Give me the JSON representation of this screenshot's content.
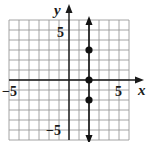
{
  "chart_data": {
    "type": "scatter",
    "title": "",
    "xlabel": "x",
    "ylabel": "y",
    "xlim": [
      -6,
      6
    ],
    "ylim": [
      -6,
      6
    ],
    "grid": true,
    "tick_labels": {
      "x": [
        {
          "value": -5,
          "label": "−5"
        },
        {
          "value": 5,
          "label": "5"
        }
      ],
      "y": [
        {
          "value": 5,
          "label": "5"
        },
        {
          "value": -5,
          "label": "−5"
        }
      ]
    },
    "series": [
      {
        "name": "vertical line x = 2",
        "kind": "line",
        "points": [
          [
            2,
            -6
          ],
          [
            2,
            6
          ]
        ],
        "arrows": "both"
      },
      {
        "name": "plotted points",
        "kind": "points",
        "points": [
          [
            2,
            3
          ],
          [
            2,
            0
          ],
          [
            2,
            -2
          ]
        ]
      }
    ],
    "colors": {
      "grid": "#9a9a9a",
      "axis": "#1a1a1a",
      "line": "#111111"
    }
  }
}
